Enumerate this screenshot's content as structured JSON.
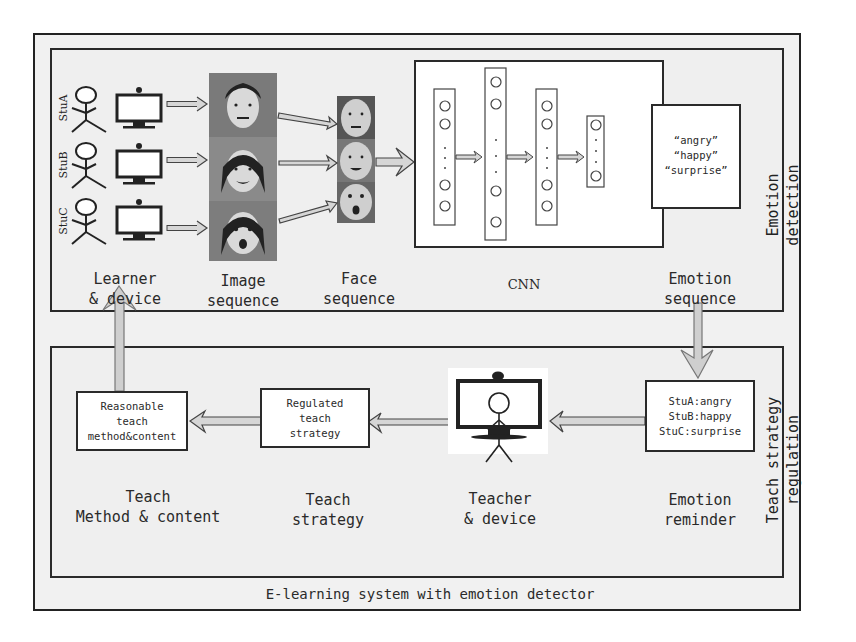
{
  "diagram": {
    "title": "E-learning system with emotion detector",
    "panels": {
      "top": {
        "name": "Emotion detection",
        "vertical_label": "Emotion\ndetection"
      },
      "bottom": {
        "name": "Teach strategy regulation",
        "vertical_label": "Teach strategy\nregulation"
      }
    },
    "learners": [
      {
        "id": "StuA",
        "label": "StuA"
      },
      {
        "id": "StuB",
        "label": "StuB"
      },
      {
        "id": "StuC",
        "label": "StuC"
      }
    ],
    "stage_labels": {
      "learner_device": "Learner\n& device",
      "image_sequence": "Image\nsequence",
      "face_sequence": "Face\nsequence",
      "cnn": "CNN",
      "emotion_sequence": "Emotion\nsequence",
      "teach_method_content": "Teach\nMethod & content",
      "teach_strategy": "Teach\nstrategy",
      "teacher_device": "Teacher\n& device",
      "emotion_reminder": "Emotion\nreminder"
    },
    "emotion_output": {
      "lines": [
        "“angry”",
        "“happy”",
        "“surprise”"
      ]
    },
    "reminder_box": {
      "lines": [
        "StuA:angry",
        "StuB:happy",
        "StuC:surprise"
      ]
    },
    "strategy_box": {
      "lines": [
        "Regulated",
        "teach",
        "strategy"
      ]
    },
    "method_box": {
      "lines": [
        "Reasonable",
        "teach",
        "method&content"
      ]
    },
    "cnn_layers": [
      {
        "nodes_top": 2,
        "nodes_bottom": 2
      },
      {
        "nodes_top": 2,
        "nodes_bottom": 2
      },
      {
        "nodes_top": 2,
        "nodes_bottom": 2
      },
      {
        "nodes_top": 1,
        "nodes_bottom": 1
      }
    ],
    "icons": [
      "stick-figure-icon",
      "monitor-with-webcam-icon",
      "face-photo",
      "hollow-arrow-icon"
    ],
    "colors": {
      "frame": "#222222",
      "panel_bg": "#efefef",
      "box_bg": "#ffffff",
      "arrow_fill": "#cfcfcf",
      "photo": "#6b6b6b"
    }
  }
}
